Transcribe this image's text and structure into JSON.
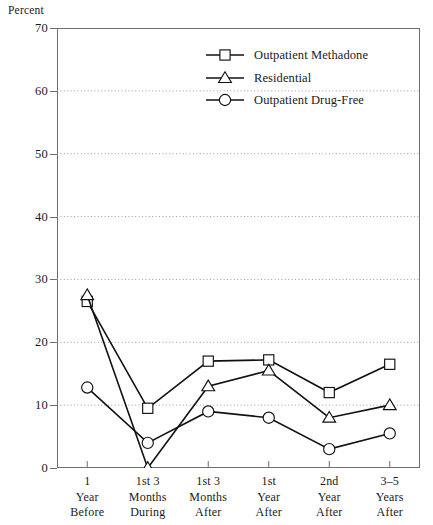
{
  "chart_data": {
    "type": "line",
    "title": "",
    "ylabel": "Percent",
    "xlabel": "",
    "ylim": [
      0,
      70
    ],
    "yticks": [
      0,
      10,
      20,
      30,
      40,
      50,
      60,
      70
    ],
    "grid": "horizontal-dotted",
    "legend_position": "top-center-right",
    "categories": [
      "1 Year Before",
      "1st 3 Months During",
      "1st 3 Months After",
      "1st Year After",
      "2nd Year After",
      "3–5 Years After"
    ],
    "category_lines": [
      [
        "1",
        "Year",
        "Before"
      ],
      [
        "1st 3",
        "Months",
        "During"
      ],
      [
        "1st 3",
        "Months",
        "After"
      ],
      [
        "1st",
        "Year",
        "After"
      ],
      [
        "2nd",
        "Year",
        "After"
      ],
      [
        "3–5",
        "Years",
        "After"
      ]
    ],
    "series": [
      {
        "name": "Outpatient Methadone",
        "marker": "square",
        "values": [
          26.5,
          9.5,
          17.0,
          17.2,
          12.0,
          16.5
        ]
      },
      {
        "name": "Residential",
        "marker": "triangle",
        "values": [
          27.5,
          0.0,
          13.0,
          15.5,
          8.0,
          10.0
        ]
      },
      {
        "name": "Outpatient Drug-Free",
        "marker": "circle",
        "values": [
          12.8,
          4.0,
          9.0,
          8.0,
          3.0,
          5.5
        ]
      }
    ],
    "colors": {
      "line": "#111111",
      "marker_fill": "#ffffff",
      "marker_stroke": "#111111",
      "axis": "#6f6f6f",
      "grid": "#9a9a9a",
      "text": "#1a1a1a"
    }
  }
}
